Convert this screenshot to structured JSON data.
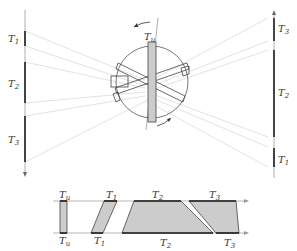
{
  "diagram": {
    "colors": {
      "detector_line": "#999999",
      "detector_segment": "#333333",
      "ray": "#d9d9d9",
      "object_outline": "#444444",
      "rotated_bar_fill": "#cccccc",
      "band_fill": "#cfcfcf",
      "axis_line": "#888888"
    },
    "left_detector": {
      "labels": [
        {
          "main": "T",
          "sub": "1"
        },
        {
          "main": "T",
          "sub": "2"
        },
        {
          "main": "T",
          "sub": "3"
        }
      ]
    },
    "right_detector": {
      "labels": [
        {
          "main": "T",
          "sub": "3"
        },
        {
          "main": "T",
          "sub": "2"
        },
        {
          "main": "T",
          "sub": "1"
        }
      ]
    },
    "object": {
      "top_label": {
        "main": "T",
        "sub": "u"
      },
      "rotation_arrows": [
        "rotation-arrow-top",
        "rotation-arrow-bottom"
      ]
    },
    "band_diagram": {
      "top_labels": [
        {
          "main": "T",
          "sub": "u"
        },
        {
          "main": "T",
          "sub": "1"
        },
        {
          "main": "T",
          "sub": "2"
        },
        {
          "main": "T",
          "sub": "3"
        }
      ],
      "bottom_labels": [
        {
          "main": "T",
          "sub": "u"
        },
        {
          "main": "T",
          "sub": "1"
        },
        {
          "main": "T",
          "sub": "2"
        },
        {
          "main": "T",
          "sub": "3"
        }
      ]
    }
  }
}
